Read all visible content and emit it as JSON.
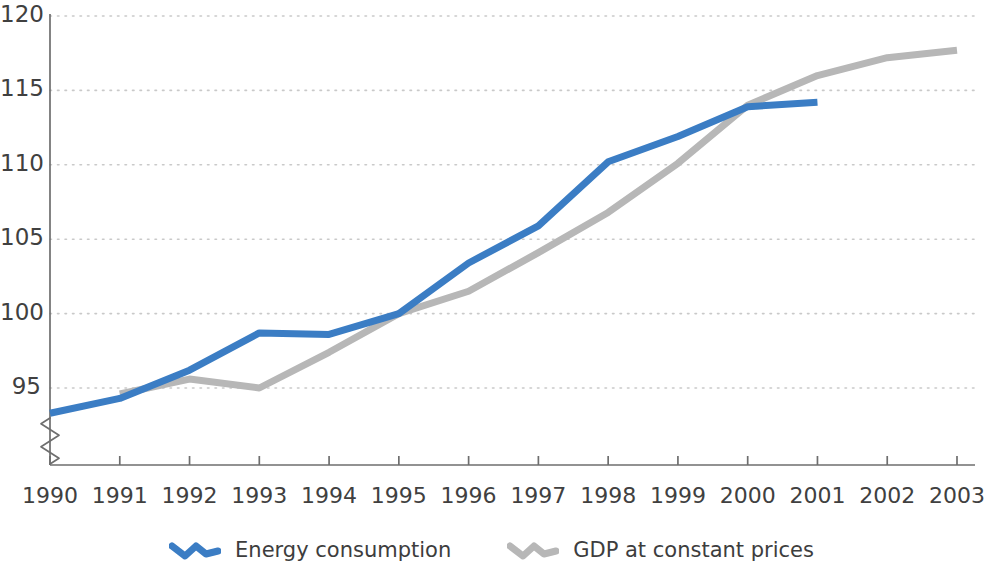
{
  "chart_data": {
    "type": "line",
    "title": "",
    "subtitle": "",
    "xlabel": "",
    "ylabel": "",
    "x": [
      1990,
      1991,
      1992,
      1993,
      1994,
      1995,
      1996,
      1997,
      1998,
      1999,
      2000,
      2001,
      2002,
      2003
    ],
    "xtick_labels": [
      "1990",
      "1991",
      "1992",
      "1993",
      "1994",
      "1995",
      "1996",
      "1997",
      "1998",
      "1999",
      "2000",
      "2001",
      "2002",
      "2003"
    ],
    "ytick_labels": [
      "95",
      "100",
      "105",
      "110",
      "115",
      "120"
    ],
    "yticks": [
      95,
      100,
      105,
      110,
      115,
      120
    ],
    "ylim": [
      92.2,
      120
    ],
    "xlim": [
      1990,
      2003
    ],
    "y_axis_break": true,
    "grid": "horizontal-dotted",
    "legend_position": "bottom-center",
    "series": [
      {
        "name": "Energy consumption",
        "color": "#3b7dc4",
        "x": [
          1990,
          1991,
          1992,
          1993,
          1994,
          1995,
          1996,
          1997,
          1998,
          1999,
          2000,
          2001
        ],
        "values": [
          93.3,
          94.3,
          96.2,
          98.7,
          98.6,
          100.0,
          103.4,
          105.9,
          110.2,
          111.9,
          113.9,
          114.2
        ]
      },
      {
        "name": "GDP at constant prices",
        "color": "#b7b7b7",
        "x": [
          1991,
          1992,
          1993,
          1994,
          1995,
          1996,
          1997,
          1998,
          1999,
          2000,
          2001,
          2002,
          2003
        ],
        "values": [
          94.6,
          95.6,
          95.0,
          97.4,
          100.0,
          101.5,
          104.1,
          106.8,
          110.1,
          114.0,
          116.0,
          117.2,
          117.7
        ]
      }
    ]
  },
  "legend": {
    "items": [
      {
        "label": "Energy consumption",
        "color": "#3b7dc4",
        "icon": "zigzag-line-icon"
      },
      {
        "label": "GDP at constant prices",
        "color": "#b7b7b7",
        "icon": "zigzag-line-icon"
      }
    ]
  },
  "axes": {
    "axis_color": "#6e6e6e",
    "grid_color": "#c9c9c9",
    "tick_color": "#6e6e6e"
  }
}
